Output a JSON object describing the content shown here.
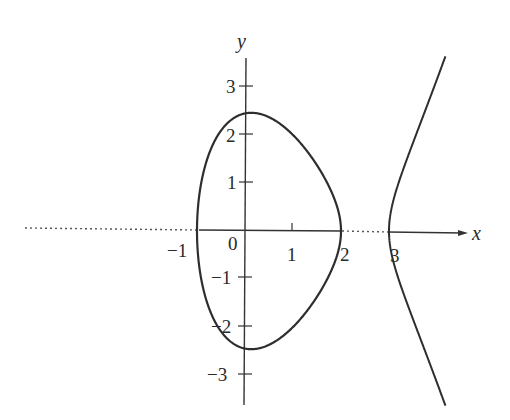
{
  "chart_data": {
    "type": "line",
    "title": "",
    "equation": "y^2 = (x+1)(x-2)(x-3)",
    "xlabel": "x",
    "ylabel": "y",
    "xlim": [
      -1.2,
      4.6
    ],
    "ylim": [
      -3.6,
      3.7
    ],
    "grid": false,
    "x_ticks": [
      {
        "value": -1,
        "label": "−1"
      },
      {
        "value": 0,
        "label": "0"
      },
      {
        "value": 1,
        "label": "1"
      },
      {
        "value": 2,
        "label": "2"
      },
      {
        "value": 3,
        "label": "3"
      }
    ],
    "y_ticks": [
      {
        "value": 3,
        "label": "3"
      },
      {
        "value": 2,
        "label": "2"
      },
      {
        "value": 1,
        "label": "1"
      },
      {
        "value": -1,
        "label": "−1"
      },
      {
        "value": -2,
        "label": "−2"
      },
      {
        "value": -3,
        "label": "−3"
      }
    ],
    "series": [
      {
        "name": "bounded-oval",
        "x_range": [
          -1,
          2
        ],
        "roots": [
          -1,
          2
        ]
      },
      {
        "name": "unbounded-branch",
        "x_range": [
          3,
          4.1
        ],
        "roots": [
          3
        ]
      }
    ],
    "annotations": [
      {
        "type": "dotted-line",
        "from_x": -5,
        "to_x": -1,
        "y": 0
      },
      {
        "type": "dotted-line",
        "from_x": 2,
        "to_x": 3,
        "y": 0
      }
    ]
  },
  "labels": {
    "x_axis": "x",
    "y_axis": "y",
    "origin": "0",
    "x_tick_neg1": "−1",
    "x_tick_1": "1",
    "x_tick_2": "2",
    "x_tick_3": "3",
    "y_tick_3": "3",
    "y_tick_2": "2",
    "y_tick_1": "1",
    "y_tick_neg1": "−1",
    "y_tick_neg2": "−2",
    "y_tick_neg3": "−3"
  },
  "colors": {
    "curve": "#2e2e2e",
    "axis": "#333333",
    "background": "#ffffff"
  }
}
